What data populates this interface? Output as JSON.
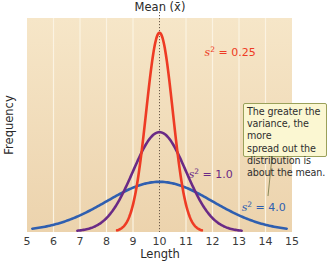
{
  "chart_data": {
    "type": "line",
    "title": "",
    "xlabel": "Length",
    "ylabel": "Frequency",
    "xlim": [
      5,
      15
    ],
    "x_ticks": [
      "5",
      "6",
      "7",
      "8",
      "9",
      "10",
      "11",
      "12",
      "13",
      "14",
      "15"
    ],
    "grid": {
      "vertical": true,
      "horizontal": false
    },
    "mean": {
      "value": 10,
      "label": "Mean (x̄)"
    },
    "series": [
      {
        "name": "s² = 0.25",
        "variance": 0.25,
        "mean": 10,
        "color": "#ee3b24",
        "x_range": [
          8.4,
          11.6
        ],
        "label": {
          "text_base": "s",
          "text_sup": "2",
          "text_rest": " = 0.25",
          "x": 11.7,
          "y_px": 56
        }
      },
      {
        "name": "s² = 1.0",
        "variance": 1.0,
        "mean": 10,
        "color": "#6a2a86",
        "x_range": [
          6.9,
          13.1
        ],
        "label": {
          "text_base": "s",
          "text_sup": "2",
          "text_rest": " = 1.0",
          "x": 11.1,
          "y_px": 178
        }
      },
      {
        "name": "s² = 4.0",
        "variance": 4.0,
        "mean": 10,
        "color": "#2f5fb0",
        "x_range": [
          5.2,
          14.8
        ],
        "label": {
          "text_base": "s",
          "text_sup": "2",
          "text_rest": " = 4.0",
          "x": 13.1,
          "y_px": 211
        }
      }
    ],
    "annotation": {
      "lines": [
        "The greater the",
        "variance, the more",
        "spread out the",
        "distribution is",
        "about the mean."
      ]
    },
    "colors": {
      "plot_bg_top": "#f6e6c8",
      "plot_bg_bottom": "#ecd3ad",
      "gridline": "#fbf3e2",
      "mean_line": "#6b5a4a",
      "callout_bg": "#fbf7d2",
      "callout_border": "#9aa05a"
    }
  }
}
